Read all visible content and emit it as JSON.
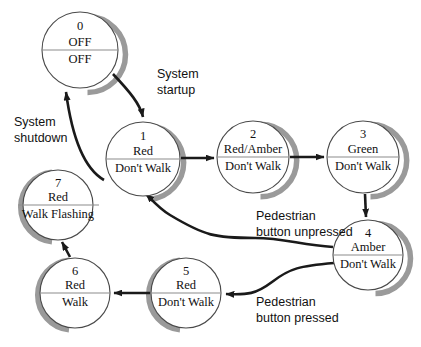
{
  "diagram": {
    "colors": {
      "circle_stroke": "#4a4a4a",
      "shadow": "#9a9a9a",
      "divider": "#8c8c8c",
      "text": "#111111",
      "arrow": "#1a1a1a",
      "background": "#ffffff"
    },
    "states": [
      {
        "id": "state-0",
        "number": "0",
        "top_label": "OFF",
        "bottom_label": "OFF",
        "cx": 80,
        "cy": 50,
        "r": 38
      },
      {
        "id": "state-1",
        "number": "1",
        "top_label": "Red",
        "bottom_label": "Don't Walk",
        "cx": 143,
        "cy": 159,
        "r": 37
      },
      {
        "id": "state-2",
        "number": "2",
        "top_label": "Red/Amber",
        "bottom_label": "Don't Walk",
        "cx": 253,
        "cy": 157,
        "r": 36
      },
      {
        "id": "state-3",
        "number": "3",
        "top_label": "Green",
        "bottom_label": "Don't Walk",
        "cx": 363,
        "cy": 157,
        "r": 36
      },
      {
        "id": "state-4",
        "number": "4",
        "top_label": "Amber",
        "bottom_label": "Don't Walk",
        "cx": 368,
        "cy": 255,
        "r": 35
      },
      {
        "id": "state-5",
        "number": "5",
        "top_label": "Red",
        "bottom_label": "Don't Walk",
        "cx": 186,
        "cy": 293,
        "r": 35
      },
      {
        "id": "state-6",
        "number": "6",
        "top_label": "Red",
        "bottom_label": "Walk",
        "cx": 75,
        "cy": 293,
        "r": 35
      },
      {
        "id": "state-7",
        "number": "7",
        "top_label": "Red",
        "bottom_label": "Walk Flashing",
        "cx": 58,
        "cy": 205,
        "r": 35
      }
    ],
    "transitions": [
      {
        "id": "transition-startup",
        "from": "0",
        "to": "1",
        "label_line1": "System",
        "label_line2": "startup",
        "label_x": 157,
        "label_y": 77
      },
      {
        "id": "transition-shutdown",
        "from": "7",
        "to": "0",
        "label_line1": "System",
        "label_line2": "shutdown",
        "label_x": 14,
        "label_y": 125
      },
      {
        "id": "transition-1-2",
        "from": "1",
        "to": "2",
        "label_line1": "",
        "label_line2": ""
      },
      {
        "id": "transition-2-3",
        "from": "2",
        "to": "3",
        "label_line1": "",
        "label_line2": ""
      },
      {
        "id": "transition-3-4",
        "from": "3",
        "to": "4",
        "label_line1": "",
        "label_line2": ""
      },
      {
        "id": "transition-4-1",
        "from": "4",
        "to": "1",
        "label_line1": "Pedestrian",
        "label_line2": "button unpressed",
        "label_x": 256,
        "label_y": 219
      },
      {
        "id": "transition-4-5",
        "from": "4",
        "to": "5",
        "label_line1": "Pedestrian",
        "label_line2": "button pressed",
        "label_x": 256,
        "label_y": 305
      },
      {
        "id": "transition-5-6",
        "from": "5",
        "to": "6",
        "label_line1": "",
        "label_line2": ""
      },
      {
        "id": "transition-6-7",
        "from": "6",
        "to": "7",
        "label_line1": "",
        "label_line2": ""
      }
    ]
  }
}
